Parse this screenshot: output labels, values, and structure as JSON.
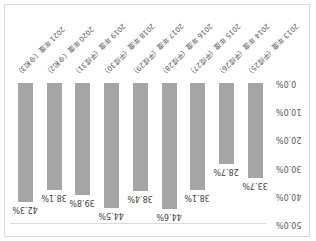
{
  "chart_data": {
    "type": "bar",
    "orientation_note": "image rendered rotated 180 degrees",
    "categories": [
      "2013 年度（平成25）",
      "2014 年度（平成26）",
      "2015 年度（平成27）",
      "2016 年度（平成28）",
      "2017 年度（平成29）",
      "2018 年度（平成30）",
      "2019 年度（平成31）",
      "2020 年度（令和2）",
      "2021 年度（令和3）"
    ],
    "values": [
      33.7,
      28.7,
      38.1,
      44.6,
      38.4,
      44.5,
      39.8,
      38.1,
      42.3
    ],
    "value_labels": [
      "33.7%",
      "28.7%",
      "38.1%",
      "44.6%",
      "38.4%",
      "44.5%",
      "39.8%",
      "38.1%",
      "42.3%"
    ],
    "yticks": [
      "0.0%",
      "10.0%",
      "20.0%",
      "30.0%",
      "40.0%",
      "50.0%"
    ],
    "ylim": [
      0,
      50
    ],
    "title": "",
    "xlabel": "",
    "ylabel": "",
    "grid": false,
    "legend": "none",
    "bar_color": "#a5a5a5"
  }
}
